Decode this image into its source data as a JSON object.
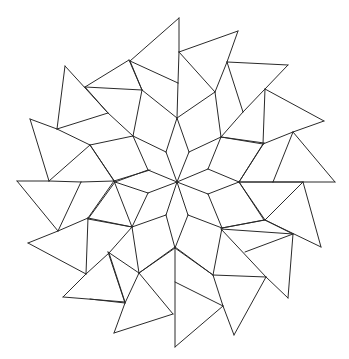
{
  "figure": {
    "title": "Rosette tiling line drawing",
    "description": "Ten-fold rosette of rhombi radiating from a central star, ringed by quadrilaterals and outer triangles",
    "stroke_color": "#2a2a2a",
    "background_color": "#ffffff",
    "center": [
      177,
      182
    ]
  },
  "polygons": [
    {
      "name": "center-rhombus-1",
      "points": [
        [
          177,
          182
        ],
        [
          166,
          152
        ],
        [
          177,
          118
        ],
        [
          189,
          152
        ]
      ]
    },
    {
      "name": "center-rhombus-2",
      "points": [
        [
          177,
          182
        ],
        [
          189,
          152
        ],
        [
          221,
          137
        ],
        [
          208,
          169
        ]
      ]
    },
    {
      "name": "center-rhombus-3",
      "points": [
        [
          177,
          182
        ],
        [
          208,
          169
        ],
        [
          239,
          182
        ],
        [
          208,
          194
        ]
      ]
    },
    {
      "name": "center-rhombus-4",
      "points": [
        [
          177,
          182
        ],
        [
          208,
          194
        ],
        [
          222,
          228
        ],
        [
          188,
          215
        ]
      ]
    },
    {
      "name": "center-rhombus-5",
      "points": [
        [
          177,
          182
        ],
        [
          188,
          215
        ],
        [
          175,
          248
        ],
        [
          166,
          215
        ]
      ]
    },
    {
      "name": "center-rhombus-6",
      "points": [
        [
          177,
          182
        ],
        [
          166,
          215
        ],
        [
          132,
          227
        ],
        [
          148,
          193
        ]
      ]
    },
    {
      "name": "center-rhombus-7",
      "points": [
        [
          177,
          182
        ],
        [
          148,
          193
        ],
        [
          115,
          182
        ],
        [
          148,
          170
        ]
      ]
    },
    {
      "name": "center-rhombus-8",
      "points": [
        [
          177,
          182
        ],
        [
          148,
          170
        ],
        [
          133,
          136
        ],
        [
          166,
          152
        ]
      ]
    },
    {
      "name": "ring-quad-1",
      "points": [
        [
          177,
          118
        ],
        [
          166,
          152
        ],
        [
          133,
          136
        ],
        [
          142,
          90
        ]
      ]
    },
    {
      "name": "ring-quad-2",
      "points": [
        [
          177,
          118
        ],
        [
          189,
          152
        ],
        [
          221,
          137
        ],
        [
          215,
          92
        ]
      ]
    },
    {
      "name": "ring-quad-3",
      "points": [
        [
          221,
          137
        ],
        [
          208,
          169
        ],
        [
          239,
          182
        ],
        [
          264,
          143
        ]
      ]
    },
    {
      "name": "ring-quad-4",
      "points": [
        [
          239,
          182
        ],
        [
          208,
          194
        ],
        [
          222,
          228
        ],
        [
          264,
          220
        ]
      ]
    },
    {
      "name": "ring-quad-5",
      "points": [
        [
          222,
          228
        ],
        [
          188,
          215
        ],
        [
          175,
          248
        ],
        [
          213,
          275
        ]
      ]
    },
    {
      "name": "ring-quad-6",
      "points": [
        [
          175,
          248
        ],
        [
          166,
          215
        ],
        [
          132,
          227
        ],
        [
          139,
          273
        ]
      ]
    },
    {
      "name": "ring-quad-7",
      "points": [
        [
          132,
          227
        ],
        [
          148,
          193
        ],
        [
          115,
          182
        ],
        [
          88,
          219
        ]
      ]
    },
    {
      "name": "ring-quad-8",
      "points": [
        [
          115,
          182
        ],
        [
          148,
          170
        ],
        [
          133,
          136
        ],
        [
          90,
          145
        ]
      ]
    },
    {
      "name": "outer-quad-n",
      "points": [
        [
          177,
          118
        ],
        [
          142,
          90
        ],
        [
          178,
          83
        ],
        [
          215,
          92
        ]
      ]
    },
    {
      "name": "outer-quad-ne",
      "points": [
        [
          221,
          137
        ],
        [
          215,
          92
        ],
        [
          265,
          89
        ],
        [
          264,
          143
        ]
      ]
    },
    {
      "name": "outer-quad-e",
      "points": [
        [
          239,
          182
        ],
        [
          264,
          143
        ],
        [
          293,
          132
        ],
        [
          273,
          182
        ],
        [
          264,
          220
        ]
      ]
    },
    {
      "name": "outer-quad-se",
      "points": [
        [
          222,
          228
        ],
        [
          264,
          220
        ],
        [
          265,
          220
        ],
        [
          221,
          229
        ],
        [
          213,
          275
        ]
      ]
    },
    {
      "name": "outer-quad-s",
      "points": [
        [
          175,
          248
        ],
        [
          213,
          275
        ],
        [
          175,
          282
        ],
        [
          139,
          273
        ]
      ]
    },
    {
      "name": "outer-quad-sw",
      "points": [
        [
          132,
          227
        ],
        [
          139,
          273
        ],
        [
          108,
          252
        ],
        [
          88,
          219
        ]
      ]
    },
    {
      "name": "outer-quad-w",
      "points": [
        [
          115,
          182
        ],
        [
          88,
          219
        ],
        [
          81,
          182
        ],
        [
          90,
          145
        ]
      ]
    },
    {
      "name": "outer-quad-nw",
      "points": [
        [
          133,
          136
        ],
        [
          90,
          145
        ],
        [
          108,
          113
        ],
        [
          142,
          90
        ]
      ]
    }
  ],
  "segments": [
    [
      [
        179,
        18
      ],
      [
        130,
        61
      ]
    ],
    [
      [
        179,
        18
      ],
      [
        179,
        52
      ]
    ],
    [
      [
        130,
        61
      ],
      [
        178,
        83
      ]
    ],
    [
      [
        130,
        61
      ],
      [
        142,
        90
      ]
    ],
    [
      [
        179,
        52
      ],
      [
        178,
        83
      ]
    ],
    [
      [
        179,
        52
      ],
      [
        238,
        31
      ]
    ],
    [
      [
        238,
        31
      ],
      [
        227,
        62
      ]
    ],
    [
      [
        238,
        31
      ],
      [
        227,
        62
      ]
    ],
    [
      [
        227,
        62
      ],
      [
        215,
        92
      ]
    ],
    [
      [
        179,
        52
      ],
      [
        215,
        92
      ]
    ],
    [
      [
        178,
        83
      ],
      [
        177,
        118
      ]
    ],
    [
      [
        142,
        90
      ],
      [
        177,
        118
      ]
    ],
    [
      [
        215,
        92
      ],
      [
        177,
        118
      ]
    ],
    [
      [
        227,
        62
      ],
      [
        288,
        65
      ]
    ],
    [
      [
        288,
        65
      ],
      [
        265,
        89
      ]
    ],
    [
      [
        227,
        62
      ],
      [
        243,
        112
      ]
    ],
    [
      [
        265,
        89
      ],
      [
        243,
        112
      ]
    ],
    [
      [
        265,
        89
      ],
      [
        324,
        121
      ]
    ],
    [
      [
        324,
        121
      ],
      [
        293,
        132
      ]
    ],
    [
      [
        265,
        89
      ],
      [
        263,
        144
      ]
    ],
    [
      [
        263,
        144
      ],
      [
        293,
        132
      ]
    ],
    [
      [
        243,
        112
      ],
      [
        221,
        137
      ]
    ],
    [
      [
        215,
        92
      ],
      [
        221,
        137
      ]
    ],
    [
      [
        293,
        132
      ],
      [
        273,
        182
      ]
    ],
    [
      [
        293,
        132
      ],
      [
        335,
        182
      ]
    ],
    [
      [
        273,
        182
      ],
      [
        335,
        182
      ]
    ],
    [
      [
        239,
        182
      ],
      [
        273,
        182
      ]
    ],
    [
      [
        263,
        144
      ],
      [
        239,
        182
      ]
    ],
    [
      [
        221,
        137
      ],
      [
        263,
        144
      ]
    ],
    [
      [
        303,
        182
      ],
      [
        265,
        220
      ]
    ],
    [
      [
        303,
        182
      ],
      [
        321,
        247
      ]
    ],
    [
      [
        265,
        220
      ],
      [
        321,
        247
      ]
    ],
    [
      [
        239,
        182
      ],
      [
        265,
        220
      ]
    ],
    [
      [
        265,
        220
      ],
      [
        222,
        228
      ]
    ],
    [
      [
        239,
        182
      ],
      [
        303,
        182
      ]
    ],
    [
      [
        221,
        229
      ],
      [
        293,
        234
      ]
    ],
    [
      [
        293,
        234
      ],
      [
        245,
        252
      ]
    ],
    [
      [
        293,
        234
      ],
      [
        288,
        298
      ]
    ],
    [
      [
        221,
        229
      ],
      [
        266,
        277
      ]
    ],
    [
      [
        266,
        277
      ],
      [
        288,
        298
      ]
    ],
    [
      [
        265,
        220
      ],
      [
        293,
        234
      ]
    ],
    [
      [
        222,
        228
      ],
      [
        213,
        275
      ]
    ],
    [
      [
        213,
        275
      ],
      [
        266,
        277
      ]
    ],
    [
      [
        266,
        277
      ],
      [
        234,
        335
      ]
    ],
    [
      [
        213,
        275
      ],
      [
        223,
        306
      ]
    ],
    [
      [
        223,
        306
      ],
      [
        234,
        335
      ]
    ],
    [
      [
        175,
        247
      ],
      [
        213,
        275
      ]
    ],
    [
      [
        175,
        247
      ],
      [
        139,
        273
      ]
    ],
    [
      [
        175,
        247
      ],
      [
        175,
        347
      ]
    ],
    [
      [
        175,
        282
      ],
      [
        223,
        306
      ]
    ],
    [
      [
        223,
        306
      ],
      [
        175,
        347
      ]
    ],
    [
      [
        139,
        273
      ],
      [
        173,
        314
      ]
    ],
    [
      [
        173,
        314
      ],
      [
        114,
        333
      ]
    ],
    [
      [
        114,
        333
      ],
      [
        125,
        303
      ]
    ],
    [
      [
        125,
        303
      ],
      [
        139,
        273
      ]
    ],
    [
      [
        108,
        252
      ],
      [
        125,
        303
      ]
    ],
    [
      [
        139,
        273
      ],
      [
        108,
        252
      ]
    ],
    [
      [
        90,
        299
      ],
      [
        125,
        303
      ]
    ],
    [
      [
        17,
        181
      ],
      [
        49,
        181
      ]
    ],
    [
      [
        49,
        181
      ],
      [
        81,
        182
      ]
    ],
    [
      [
        81,
        182
      ],
      [
        114,
        181
      ]
    ],
    [
      [
        17,
        181
      ],
      [
        58,
        231
      ]
    ],
    [
      [
        58,
        231
      ],
      [
        81,
        182
      ]
    ],
    [
      [
        58,
        231
      ],
      [
        88,
        218
      ]
    ],
    [
      [
        88,
        218
      ],
      [
        114,
        181
      ]
    ],
    [
      [
        88,
        218
      ],
      [
        132,
        227
      ]
    ],
    [
      [
        28,
        243
      ],
      [
        58,
        231
      ]
    ],
    [
      [
        28,
        243
      ],
      [
        86,
        274
      ]
    ],
    [
      [
        86,
        274
      ],
      [
        88,
        218
      ]
    ],
    [
      [
        86,
        274
      ],
      [
        109,
        253
      ]
    ],
    [
      [
        109,
        253
      ],
      [
        132,
        227
      ]
    ],
    [
      [
        86,
        274
      ],
      [
        63,
        297
      ]
    ],
    [
      [
        63,
        297
      ],
      [
        125,
        302
      ]
    ],
    [
      [
        109,
        253
      ],
      [
        125,
        302
      ]
    ],
    [
      [
        114,
        181
      ],
      [
        132,
        227
      ]
    ],
    [
      [
        65,
        66
      ],
      [
        57,
        129
      ]
    ],
    [
      [
        65,
        66
      ],
      [
        108,
        113
      ]
    ],
    [
      [
        85,
        87
      ],
      [
        129,
        60
      ]
    ],
    [
      [
        85,
        87
      ],
      [
        142,
        90
      ]
    ],
    [
      [
        129,
        60
      ],
      [
        142,
        90
      ]
    ],
    [
      [
        108,
        113
      ],
      [
        57,
        129
      ]
    ],
    [
      [
        108,
        113
      ],
      [
        133,
        136
      ]
    ],
    [
      [
        30,
        119
      ],
      [
        57,
        129
      ]
    ],
    [
      [
        30,
        119
      ],
      [
        49,
        181
      ]
    ],
    [
      [
        57,
        129
      ],
      [
        90,
        145
      ]
    ],
    [
      [
        90,
        145
      ],
      [
        133,
        136
      ]
    ],
    [
      [
        90,
        145
      ],
      [
        49,
        181
      ]
    ],
    [
      [
        90,
        145
      ],
      [
        114,
        181
      ]
    ],
    [
      [
        114,
        181
      ],
      [
        150,
        170
      ]
    ],
    [
      [
        142,
        90
      ],
      [
        133,
        136
      ]
    ],
    [
      [
        85,
        87
      ],
      [
        108,
        113
      ]
    ]
  ]
}
